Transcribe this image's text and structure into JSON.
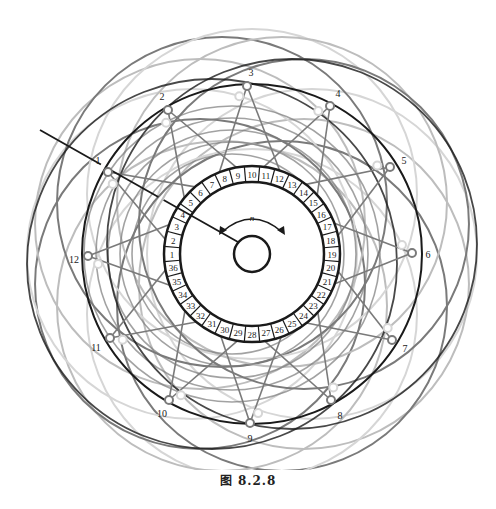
{
  "caption": "图    8.2.8",
  "rotation_label": "n",
  "center": {
    "x": 252,
    "y": 254
  },
  "commutator": {
    "segments": 36,
    "outer_radius": 88,
    "inner_radius": 72,
    "start_segment_angle_deg": 180,
    "labels": [
      "1",
      "2",
      "3",
      "4",
      "5",
      "6",
      "7",
      "8",
      "9",
      "10",
      "11",
      "12",
      "13",
      "14",
      "15",
      "16",
      "17",
      "18",
      "19",
      "20",
      "21",
      "22",
      "23",
      "24",
      "25",
      "26",
      "27",
      "28",
      "29",
      "30",
      "31",
      "32",
      "33",
      "34",
      "35",
      "36"
    ]
  },
  "shaft_radius": 18,
  "terminals": [
    {
      "label": "1",
      "x": 108,
      "y": 172,
      "lx": 98,
      "ly": 160
    },
    {
      "label": "2",
      "x": 168,
      "y": 110,
      "lx": 162,
      "ly": 96
    },
    {
      "label": "3",
      "x": 247,
      "y": 86,
      "lx": 251,
      "ly": 72
    },
    {
      "label": "4",
      "x": 330,
      "y": 106,
      "lx": 338,
      "ly": 93
    },
    {
      "label": "5",
      "x": 390,
      "y": 167,
      "lx": 404,
      "ly": 160
    },
    {
      "label": "6",
      "x": 412,
      "y": 253,
      "lx": 428,
      "ly": 254
    },
    {
      "label": "7",
      "x": 392,
      "y": 340,
      "lx": 405,
      "ly": 348
    },
    {
      "label": "8",
      "x": 331,
      "y": 400,
      "lx": 340,
      "ly": 415
    },
    {
      "label": "9",
      "x": 250,
      "y": 423,
      "lx": 250,
      "ly": 438
    },
    {
      "label": "10",
      "x": 169,
      "y": 400,
      "lx": 162,
      "ly": 413
    },
    {
      "label": "11",
      "x": 110,
      "y": 338,
      "lx": 96,
      "ly": 347
    },
    {
      "label": "12",
      "x": 88,
      "y": 256,
      "lx": 74,
      "ly": 259
    }
  ],
  "colors": {
    "dark": "#1a1a1a",
    "mid": "#7a7a7a",
    "light": "#bdbdbd",
    "lighter": "#d6d6d6"
  },
  "lead_line": {
    "x1": 40,
    "y1": 130,
    "x2": 110,
    "y2": 170
  }
}
